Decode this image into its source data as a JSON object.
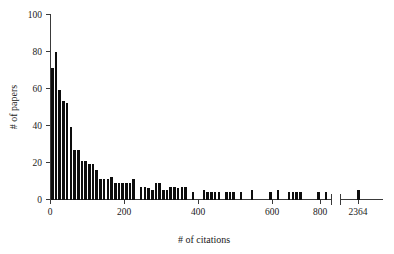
{
  "chart_data": {
    "type": "bar",
    "title": "",
    "subtitle": "",
    "xlabel": "# of citations",
    "ylabel": "# of papers",
    "xlim": [
      0,
      800
    ],
    "ylim": [
      0,
      100
    ],
    "grid": false,
    "legend": null,
    "bin_width": 10,
    "x_ticks": [
      0,
      200,
      400,
      600,
      800
    ],
    "x_tick_labels": [
      "0",
      "200",
      "400",
      "600",
      "800"
    ],
    "y_ticks": [
      0,
      20,
      40,
      60,
      80,
      100
    ],
    "y_tick_labels": [
      "0",
      "20",
      "40",
      "60",
      "80",
      "100"
    ],
    "axis_break": {
      "present": true,
      "after_value": 800,
      "outlier_tick_label": "2364",
      "outlier_value": 2364,
      "outlier_count": 1
    },
    "bar_color": "#0d0d0d",
    "categories": [
      "5",
      "15",
      "25",
      "35",
      "45",
      "55",
      "65",
      "75",
      "85",
      "95",
      "105",
      "115",
      "125",
      "135",
      "145",
      "155",
      "165",
      "175",
      "185",
      "195",
      "205",
      "215",
      "225",
      "235",
      "245",
      "255",
      "265",
      "275",
      "285",
      "295",
      "305",
      "315",
      "325",
      "335",
      "345",
      "355",
      "365",
      "375",
      "385",
      "395",
      "405",
      "415",
      "425",
      "435",
      "445",
      "455",
      "465",
      "475",
      "485",
      "495",
      "505",
      "515",
      "525",
      "535",
      "545",
      "555",
      "565",
      "575",
      "585",
      "595",
      "605",
      "615",
      "625",
      "635",
      "645",
      "655",
      "665",
      "675",
      "685",
      "695",
      "705",
      "715",
      "725",
      "735",
      "745",
      "755",
      "2364"
    ],
    "values": [
      71,
      80,
      59,
      53,
      52,
      39,
      27,
      27,
      21,
      21,
      19,
      19,
      16,
      11,
      11,
      11,
      12,
      9,
      9,
      9,
      9,
      9,
      11,
      0,
      7,
      7,
      6,
      5,
      9,
      9,
      5,
      5,
      7,
      7,
      6,
      7,
      7,
      0,
      4,
      0,
      0,
      5,
      4,
      4,
      4,
      4,
      0,
      4,
      4,
      4,
      0,
      4,
      0,
      0,
      5,
      0,
      0,
      0,
      0,
      4,
      0,
      5,
      0,
      0,
      4,
      4,
      4,
      4,
      0,
      0,
      0,
      0,
      4,
      0,
      4,
      0,
      5
    ]
  }
}
